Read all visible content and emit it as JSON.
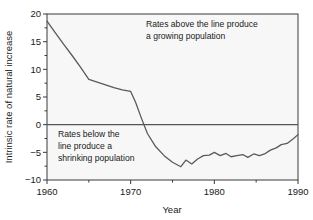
{
  "chart_data": {
    "type": "line",
    "title": "",
    "xlabel": "Year",
    "ylabel": "Intrinsic rate of natural increase",
    "xlim": [
      1960,
      1990
    ],
    "ylim": [
      -10,
      20
    ],
    "grid": false,
    "legend": "none",
    "x_ticks_major": [
      1960,
      1970,
      1980,
      1990
    ],
    "x_ticks_minor": [
      1965,
      1975,
      1985
    ],
    "y_ticks_major": [
      20,
      15,
      10,
      5,
      0,
      -5,
      -10
    ],
    "y_ticks_minor": [
      17.5,
      12.5,
      7.5,
      2.5,
      -2.5,
      -7.5
    ],
    "x_tick_labels": [
      "1960",
      "1970",
      "1980",
      "1990"
    ],
    "y_tick_labels": [
      "20",
      "15",
      "10",
      "5",
      "0",
      "−5",
      "−10"
    ],
    "reference_line": {
      "y": 0,
      "label": "zero growth line"
    },
    "series": [
      {
        "name": "Intrinsic rate of natural increase",
        "color": "#5a5a5a",
        "x": [
          1960,
          1961,
          1962,
          1963,
          1964,
          1965,
          1966,
          1967,
          1968,
          1969,
          1970,
          1970.6,
          1971.2,
          1972,
          1973,
          1974,
          1975,
          1976,
          1976.6,
          1977.3,
          1978,
          1978.7,
          1979.4,
          1980,
          1980.7,
          1981.4,
          1982,
          1982.7,
          1983.4,
          1984,
          1984.7,
          1985.4,
          1986,
          1986.7,
          1987.4,
          1988,
          1988.7,
          1989.4,
          1990
        ],
        "y": [
          18.7,
          16.6,
          14.5,
          12.5,
          10.4,
          8.2,
          7.7,
          7.2,
          6.7,
          6.3,
          6.0,
          4.0,
          1.5,
          -1.6,
          -4.0,
          -5.6,
          -6.8,
          -7.6,
          -6.4,
          -7.1,
          -6.2,
          -5.6,
          -5.5,
          -5.0,
          -5.6,
          -5.2,
          -5.8,
          -5.6,
          -5.4,
          -5.9,
          -5.3,
          -5.6,
          -5.3,
          -4.6,
          -4.2,
          -3.6,
          -3.4,
          -2.6,
          -1.8
        ]
      }
    ],
    "annotations": [
      {
        "id": "above-line-note",
        "lines": [
          "Rates above the line produce",
          "a growing population"
        ],
        "region": "upper"
      },
      {
        "id": "below-line-note",
        "lines": [
          "Rates below the",
          "line produce a",
          "shrinking population"
        ],
        "region": "lower"
      }
    ],
    "colors": {
      "plot_background": "#f7f7f7",
      "figure_background": "#ffffff",
      "axis": "#3a3a3a",
      "data_line": "#5a5a5a",
      "zero_line": "#555555",
      "text": "#1a1a1a"
    }
  }
}
